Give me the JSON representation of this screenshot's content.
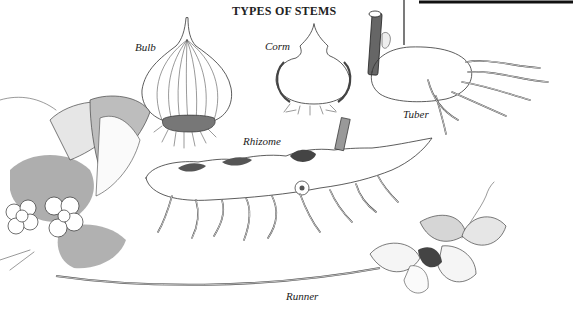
{
  "figure": {
    "title": "TYPES OF STEMS",
    "labels": {
      "bulb": "Bulb",
      "corm": "Corm",
      "tuber": "Tuber",
      "rhizome": "Rhizome",
      "runner": "Runner"
    }
  },
  "colors": {
    "background": "#ffffff",
    "ink": "#333333",
    "shade_dark": "#555555",
    "shade_light": "#cccccc",
    "frame_line": "#111111"
  }
}
